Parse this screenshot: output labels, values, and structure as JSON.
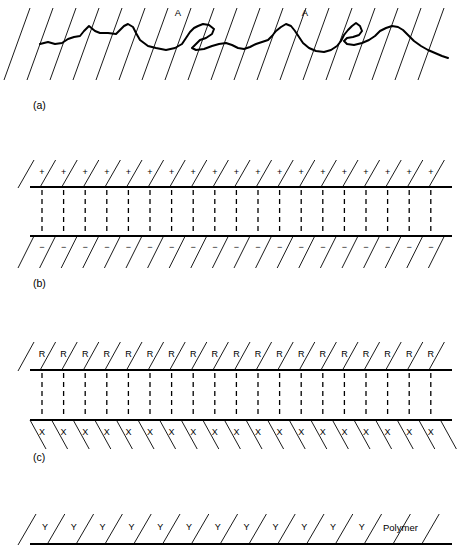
{
  "figure": {
    "width": 473,
    "height": 549,
    "background": "#ffffff",
    "ink": "#000000"
  },
  "panels": [
    {
      "id": "a",
      "label": "(a)",
      "label_x": 33,
      "label_y": 109,
      "type": "rough-interface",
      "hatch_count": 19,
      "hatch_x_start": 30,
      "hatch_x_step": 23.0,
      "hatch_dx": -26,
      "hatch_y_top": 8,
      "hatch_y_bottom": 80,
      "markers": [
        {
          "text": "A",
          "x": 178,
          "y": 16
        },
        {
          "text": "A",
          "x": 305,
          "y": 16
        }
      ],
      "wave_points": "40,44 48,42 55,44 62,43 68,39 74,37 80,36 84,31 89,26 95,31 100,33 108,33 116,34 120,30 124,26 128,24 133,27 136,33 140,40 148,46 156,48 166,50 175,48 182,44 186,38 190,32 194,28 198,26 203,24 209,25 214,29 212,34 206,38 200,40 196,44 192,48 196,50 204,49 212,46 219,44 226,43 232,45 238,48 244,49 250,47 256,44 262,42 268,40 272,36 276,31 281,27 286,24 291,26 295,31 299,37 303,43 309,48 316,51 324,52 331,50 337,46 341,41 344,35 348,30 352,26 356,23 360,26 362,31 359,35 353,37 347,38 344,41 347,44 354,45 362,43 369,40 375,36 380,31 386,28 392,26 398,27 403,30 408,35 414,41 421,46 428,50 435,53 442,56 448,58"
    },
    {
      "id": "b",
      "label": "(b)",
      "label_x": 33,
      "label_y": 287,
      "type": "electrostatic",
      "line_top_y": 187,
      "line_bottom_y": 236,
      "line_x_start": 30,
      "line_x_end": 452,
      "top_symbol": "+",
      "bottom_symbol": "−",
      "symbol_count": 19,
      "symbol_x_start": 42,
      "symbol_x_step": 21.6,
      "top_symbol_y": 173,
      "bottom_symbol_y": 248,
      "hatch_top_count": 20,
      "hatch_top_x_start": 34,
      "hatch_top_x_step": 21.6,
      "hatch_top_dx": -16,
      "hatch_top_y_from": 160,
      "hatch_top_y_to": 188,
      "hatch_bottom_count": 20,
      "hatch_bottom_x_start": 34,
      "hatch_bottom_x_step": 21.6,
      "hatch_bottom_dx": -16,
      "hatch_bottom_y_from": 236,
      "hatch_bottom_y_to": 268,
      "dash_count": 19,
      "dash_x_start": 42,
      "dash_x_step": 21.6
    },
    {
      "id": "c",
      "label": "(c)",
      "label_x": 33,
      "label_y": 461,
      "type": "chemical-bonding",
      "line_top_y": 370,
      "line_bottom_y": 420,
      "line_x_start": 30,
      "line_x_end": 452,
      "top_symbol": "R",
      "bottom_symbol": "X",
      "symbol_count": 19,
      "symbol_x_start": 42,
      "symbol_x_step": 21.6,
      "top_symbol_y": 355,
      "bottom_symbol_y": 433,
      "hatch_top_count": 20,
      "hatch_top_x_start": 34,
      "hatch_top_x_step": 21.6,
      "hatch_top_dx": -16,
      "hatch_top_y_from": 342,
      "hatch_top_y_to": 371,
      "hatch_bottom_count": 20,
      "hatch_bottom_x_start": 30,
      "hatch_bottom_x_step": 21.6,
      "hatch_bottom_dx": 16,
      "hatch_bottom_y_from": 420,
      "hatch_bottom_y_to": 449,
      "dash_count": 19,
      "dash_x_start": 42,
      "dash_x_step": 21.6
    },
    {
      "id": "d",
      "label": "",
      "label_x": 0,
      "label_y": 0,
      "type": "interdiffusion",
      "line_y": 544,
      "line_x_start": 30,
      "line_x_end": 452,
      "symbol": "Y",
      "symbol_count": 12,
      "symbol_x_start": 45,
      "symbol_x_step": 28.8,
      "symbol_y": 528,
      "hatch_count": 15,
      "hatch_x_start": 36,
      "hatch_x_step": 28.8,
      "hatch_dx": -18,
      "hatch_y_from": 514,
      "hatch_y_to": 545,
      "annotation": {
        "text": "Polymer",
        "x": 383,
        "y": 531
      }
    }
  ]
}
